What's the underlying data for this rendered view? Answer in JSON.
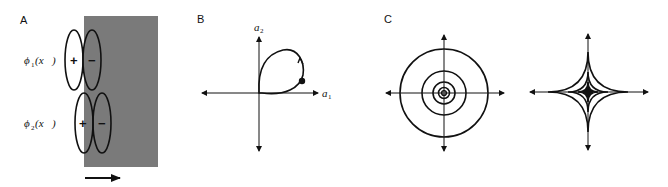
{
  "figure": {
    "panels": [
      {
        "id": "A",
        "label": "A",
        "filters": [
          {
            "name": "phi1",
            "label_main": "ϕ",
            "label_sub": "1",
            "label_arg": "(x⃗)",
            "plus": "+",
            "minus": "−"
          },
          {
            "name": "phi2",
            "label_main": "ϕ",
            "label_sub": "2",
            "label_arg": "(x⃗)",
            "plus": "+",
            "minus": "−"
          }
        ],
        "stimulus_color": "#7a7a7a",
        "motion_arrow": "right"
      },
      {
        "id": "B",
        "label": "B",
        "x_axis_label": "a",
        "x_axis_sub": "1",
        "y_axis_label": "a",
        "y_axis_sub": "2",
        "trajectory": "closed loop in first quadrant with counterclockwise arrow and dot marker"
      },
      {
        "id": "C",
        "label": "C",
        "left_plot": "concentric circles",
        "left_radii": [
          44,
          22,
          11,
          5,
          2
        ],
        "right_plot": "nested astroids",
        "right_sizes": [
          40,
          20,
          10,
          5
        ]
      }
    ]
  }
}
